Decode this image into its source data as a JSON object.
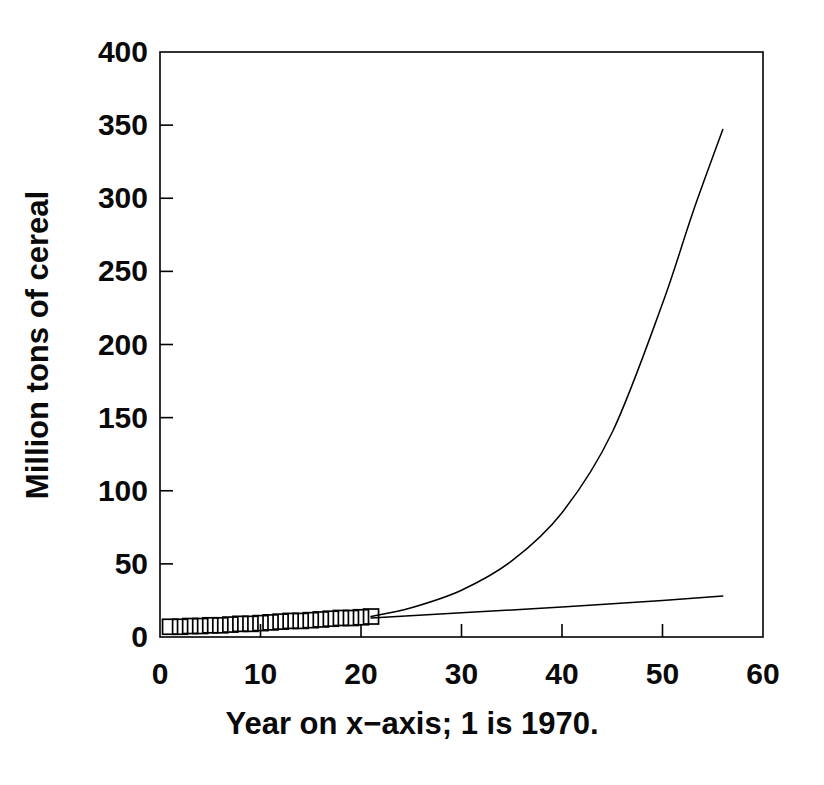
{
  "chart_data": {
    "type": "line",
    "title": "",
    "subtitle": "",
    "xlabel": "Year on x−axis; 1 is 1970.",
    "ylabel": "Million tons of cereal",
    "xlim": [
      0,
      60
    ],
    "ylim": [
      0,
      400
    ],
    "xticks": [
      0,
      10,
      20,
      30,
      40,
      50,
      60
    ],
    "yticks": [
      0,
      50,
      100,
      150,
      200,
      250,
      300,
      350,
      400
    ],
    "xtick_labels": [
      "0",
      "10",
      "20",
      "30",
      "40",
      "50",
      "60"
    ],
    "ytick_labels": [
      "0",
      "50",
      "100",
      "150",
      "200",
      "250",
      "300",
      "350",
      "400"
    ],
    "grid": false,
    "legend": "none",
    "line_color": "#000000",
    "marker_color": "#000000",
    "background_color": "#ffffff",
    "series": [
      {
        "name": "observed",
        "style": "open-square-markers",
        "x": [
          1,
          2,
          3,
          4,
          5,
          6,
          7,
          8,
          9,
          10,
          11,
          12,
          13,
          14,
          15,
          16,
          17,
          18,
          19,
          20,
          21
        ],
        "values": [
          7,
          7,
          7.5,
          7.5,
          8,
          8,
          8.5,
          9,
          9,
          9.5,
          10,
          10.5,
          11,
          11,
          11.5,
          12,
          12.5,
          13,
          13,
          13.5,
          14
        ]
      },
      {
        "name": "exponential-projection",
        "style": "solid-curve",
        "x": [
          21,
          25,
          30,
          35,
          40,
          45,
          50,
          53,
          56
        ],
        "values": [
          14,
          20,
          32,
          52,
          85,
          140,
          228,
          290,
          347
        ]
      },
      {
        "name": "linear-projection",
        "style": "solid-line",
        "x": [
          21,
          30,
          40,
          50,
          56
        ],
        "values": [
          13,
          16.5,
          20.5,
          25,
          28
        ]
      }
    ]
  },
  "axes": {
    "y_title": "Million tons of cereal",
    "x_title": "Year on x−axis; 1 is 1970."
  }
}
